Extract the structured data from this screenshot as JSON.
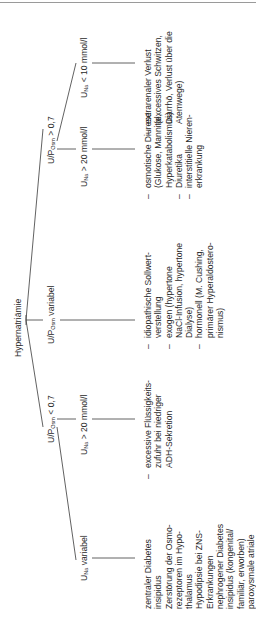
{
  "diagram": {
    "root": "Hypernatriämie",
    "branches": [
      {
        "id": "osm-lt",
        "label_prefix": "U/P",
        "label_sub": "Osm",
        "label_suffix": " < 0,7",
        "children": [
          {
            "id": "na-variabel",
            "label_prefix": "U",
            "label_sub": "Na",
            "label_suffix": " variabel",
            "items": [
              "zentraler Diabetes insipidus",
              "Zerstörung der Osmorezeptoren im Hypothalamus",
              "Hypodipsie bei ZNS-Erkrankungen",
              "nephrogener Diabetes insipidus (kongenital/familiär, erworben)",
              "paroxysmale atriale"
            ],
            "lines": [
              "zentraler Diabetes",
              "insipidus",
              "Zerstörung der Osmo-",
              "rezeptoren im Hypo-",
              "thalamus",
              "Hypodipsie bei ZNS-",
              "Erkrankungen",
              "nephrogener Diabetes",
              "insipidus (kongenital/",
              "familiär, erworben)",
              "paroxysmale atriale"
            ]
          },
          {
            "id": "na-gt20-a",
            "label_prefix": "U",
            "label_sub": "Na",
            "label_suffix": " > 20 mmol/l",
            "items": [
              [
                "excessive Flüssigkeits-",
                "zufuhr bei niedriger",
                "ADH-Sekretion"
              ]
            ]
          }
        ]
      },
      {
        "id": "osm-var",
        "label_prefix": "U/P",
        "label_sub": "Osm",
        "label_suffix": " variabel",
        "items": [
          [
            "idiopathische Sollwert-",
            "verstellung"
          ],
          [
            "exogen (hypertone",
            "NaCl-Infusion, hypertone",
            "Dialyse)"
          ],
          [
            "hormonell (M. Cushing,",
            "primärer Hyperaldostero-",
            "nismus)"
          ]
        ]
      },
      {
        "id": "osm-gt",
        "label_prefix": "U/P",
        "label_sub": "Osm",
        "label_suffix": " > 0,7",
        "children": [
          {
            "id": "na-gt20-b",
            "label_prefix": "U",
            "label_sub": "Na",
            "label_suffix": " > 20 mmol/l",
            "items": [
              [
                "osmotische Diurese",
                "(Glukose, Mannitol,",
                "Hyperkatabolismus)"
              ],
              [
                "Diuretika"
              ],
              [
                "interstitielle Nieren-",
                "erkrankung"
              ]
            ]
          },
          {
            "id": "na-lt10",
            "label_prefix": "U",
            "label_sub": "Na",
            "label_suffix": " < 10 mmol/l",
            "items": [
              [
                "extrarenaler Verlust",
                "(excessives Schwitzen,",
                "Diarrhö, Verlust über die",
                "Atemwege)"
              ]
            ]
          }
        ]
      }
    ]
  }
}
